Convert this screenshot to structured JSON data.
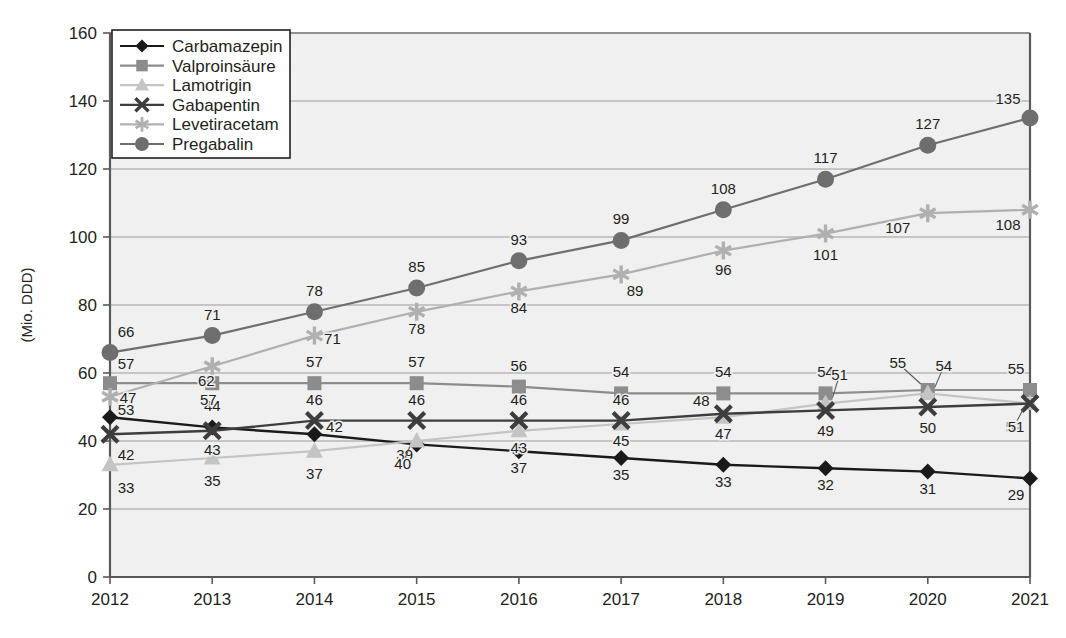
{
  "chart_data": {
    "type": "line",
    "title": "",
    "xlabel": "",
    "ylabel": "(Mio. DDD)",
    "categories": [
      "2012",
      "2013",
      "2014",
      "2015",
      "2016",
      "2017",
      "2018",
      "2019",
      "2020",
      "2021"
    ],
    "x": [
      2012,
      2013,
      2014,
      2015,
      2016,
      2017,
      2018,
      2019,
      2020,
      2021
    ],
    "ylim": [
      0,
      160
    ],
    "ytick_labels": [
      "0",
      "20",
      "40",
      "60",
      "80",
      "100",
      "120",
      "140",
      "160"
    ],
    "yticks": [
      0,
      20,
      40,
      60,
      80,
      100,
      120,
      140,
      160
    ],
    "grid": "horizontal",
    "legend_position": "top-left",
    "series": [
      {
        "name": "Carbamazepin",
        "marker": "diamond",
        "color": "#1a1a1a",
        "line_color": "#1a1a1a",
        "values": [
          47,
          44,
          42,
          39,
          37,
          35,
          33,
          32,
          31,
          29
        ]
      },
      {
        "name": "Valproinsäure",
        "marker": "square",
        "color": "#8c8c8c",
        "line_color": "#8c8c8c",
        "values": [
          57,
          57,
          57,
          57,
          56,
          54,
          54,
          54,
          55,
          55
        ]
      },
      {
        "name": "Lamotrigin",
        "marker": "triangle",
        "color": "#c4c4c4",
        "line_color": "#c4c4c4",
        "values": [
          33,
          35,
          37,
          40,
          43,
          45,
          47,
          51,
          54,
          51
        ]
      },
      {
        "name": "Gabapentin",
        "marker": "cross",
        "color": "#3d3d3d",
        "line_color": "#3d3d3d",
        "values": [
          42,
          43,
          46,
          46,
          46,
          46,
          48,
          49,
          50,
          51
        ]
      },
      {
        "name": "Levetiracetam",
        "marker": "asterisk",
        "color": "#b0b0b0",
        "line_color": "#b0b0b0",
        "values": [
          53,
          62,
          71,
          78,
          84,
          89,
          96,
          101,
          107,
          108
        ]
      },
      {
        "name": "Pregabalin",
        "marker": "circle",
        "color": "#6e6e6e",
        "line_color": "#6e6e6e",
        "values": [
          66,
          71,
          78,
          85,
          93,
          99,
          108,
          117,
          127,
          135
        ]
      }
    ],
    "colors": {
      "plot_background": "#f0f0f0",
      "grid": "#9a9a9a",
      "axis": "#58595b",
      "text": "#231f20"
    }
  }
}
